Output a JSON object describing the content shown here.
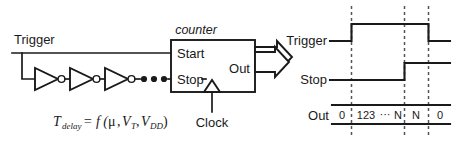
{
  "figure": {
    "title_block": "counter",
    "left_circuit": {
      "trigger_label": "Trigger",
      "inverter_count_shown": 4,
      "ellipsis": "• • •",
      "equation": {
        "t": "T",
        "t_sub": "delay",
        "equals": "= f (",
        "mu": "μ",
        "comma1": ",",
        "v1": "V",
        "v1_sub": "T",
        "comma2": ",",
        "v2": "V",
        "v2_sub": "DD",
        "close": ")"
      }
    },
    "counter_block": {
      "name": "counter",
      "input_start": "Start",
      "input_stop": "Stop",
      "output": "Out",
      "clock_label": "Clock"
    },
    "timing": {
      "rows": [
        {
          "name": "trigger-waveform",
          "label": "Trigger"
        },
        {
          "name": "stop-waveform",
          "label": "Stop"
        },
        {
          "name": "out-waveform",
          "label": "Out"
        }
      ],
      "out_values": [
        "0",
        "123",
        "···",
        "N",
        "N",
        "0"
      ],
      "out_value_0": "0",
      "out_value_123": "123",
      "out_value_dots": "···",
      "out_value_N1": "N",
      "out_value_N2": "N",
      "out_value_0b": "0"
    },
    "colors": {
      "ink": "#1a1a1a",
      "dashed": "#555555",
      "background": "#ffffff"
    }
  }
}
